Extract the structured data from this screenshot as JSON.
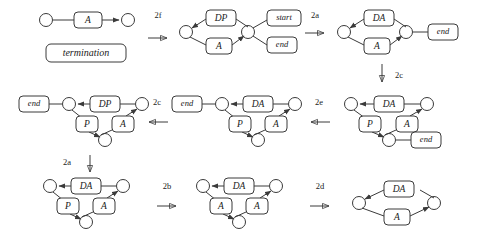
{
  "diagram": {
    "colors": {
      "stroke": "#3a3a3a",
      "text": "#1a1a1a",
      "background": "#ffffff"
    },
    "annotations": {
      "termination": "termination"
    },
    "steps": [
      {
        "id": "step-2f",
        "label": "2f",
        "direction": "right"
      },
      {
        "id": "step-2a-top",
        "label": "2a",
        "direction": "right"
      },
      {
        "id": "step-2c-top",
        "label": "2c",
        "direction": "down"
      },
      {
        "id": "step-2e",
        "label": "2e",
        "direction": "left"
      },
      {
        "id": "step-2c-mid",
        "label": "2c",
        "direction": "left"
      },
      {
        "id": "step-2a-bottom",
        "label": "2a",
        "direction": "down"
      },
      {
        "id": "step-2b",
        "label": "2b",
        "direction": "right"
      },
      {
        "id": "step-2d",
        "label": "2d",
        "direction": "right"
      }
    ],
    "graphs": [
      {
        "id": "graph-1",
        "name": "terminal-graph",
        "node_count": 2,
        "edge_labels": [
          "A"
        ],
        "attached_labels": []
      },
      {
        "id": "graph-2",
        "name": "dp-a-start-end-graph",
        "node_count": 2,
        "edge_labels": [
          "DP",
          "A"
        ],
        "attached_labels": [
          "start",
          "end"
        ]
      },
      {
        "id": "graph-3",
        "name": "da-a-end-graph",
        "node_count": 2,
        "edge_labels": [
          "DA",
          "A"
        ],
        "attached_labels": [
          "end"
        ]
      },
      {
        "id": "graph-4",
        "name": "da-p-a-end-graph",
        "node_count": 3,
        "edge_labels": [
          "DA",
          "P",
          "A"
        ],
        "attached_labels": [
          "end"
        ]
      },
      {
        "id": "graph-5",
        "name": "da-p-a-end-left-graph",
        "node_count": 3,
        "edge_labels": [
          "DA",
          "P",
          "A"
        ],
        "attached_labels": [
          "end"
        ]
      },
      {
        "id": "graph-6",
        "name": "dp-p-a-end-graph",
        "node_count": 3,
        "edge_labels": [
          "DP",
          "P",
          "A"
        ],
        "attached_labels": [
          "end"
        ]
      },
      {
        "id": "graph-7",
        "name": "da-p-a-graph",
        "node_count": 3,
        "edge_labels": [
          "DA",
          "P",
          "A"
        ],
        "attached_labels": []
      },
      {
        "id": "graph-8",
        "name": "da-a-a-graph",
        "node_count": 3,
        "edge_labels": [
          "DA",
          "A",
          "A"
        ],
        "attached_labels": []
      },
      {
        "id": "graph-9",
        "name": "da-a-final-graph",
        "node_count": 2,
        "edge_labels": [
          "DA",
          "A"
        ],
        "attached_labels": []
      }
    ],
    "labels": {
      "A": "A",
      "DP": "DP",
      "DA": "DA",
      "P": "P",
      "start": "start",
      "end": "end",
      "end2": "end",
      "end3": "end",
      "end4": "end",
      "end5": "end",
      "end6": "end",
      "step_2f": "2f",
      "step_2a_top": "2a",
      "step_2c_top": "2c",
      "step_2e": "2e",
      "step_2c_mid": "2c",
      "step_2a_bottom": "2a",
      "step_2b": "2b",
      "step_2d": "2d"
    }
  }
}
